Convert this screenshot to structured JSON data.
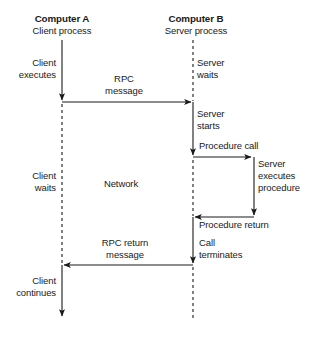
{
  "diagram": {
    "type": "sequence-diagram",
    "colors": {
      "line": "#1a1a1a",
      "text": "#1a1a1a",
      "background": "#ffffff"
    },
    "lifelines": [
      {
        "id": "computer-a",
        "title": "Computer A",
        "subtitle": "Client process",
        "x": 62
      },
      {
        "id": "computer-b",
        "title": "Computer B",
        "subtitle": "Server process",
        "x": 193
      }
    ],
    "labels": {
      "client_executes": "Client\nexecutes",
      "client_executes_line1": "Client",
      "client_executes_line2": "executes",
      "client_waits_line1": "Client",
      "client_waits_line2": "waits",
      "client_continues_line1": "Client",
      "client_continues_line2": "continues",
      "server_waits_line1": "Server",
      "server_waits_line2": "waits",
      "server_starts_line1": "Server",
      "server_starts_line2": "starts",
      "server_executes_line1": "Server",
      "server_executes_line2": "executes",
      "server_executes_line3": "procedure",
      "rpc_message_line1": "RPC",
      "rpc_message_line2": "message",
      "rpc_return_line1": "RPC return",
      "rpc_return_line2": "message",
      "network": "Network",
      "procedure_call": "Procedure call",
      "procedure_return": "Procedure return",
      "call_terminates_line1": "Call",
      "call_terminates_line2": "terminates"
    },
    "messages": [
      {
        "name": "rpc-message",
        "from": "computer-a",
        "to": "computer-b",
        "direction": "right",
        "y": 102,
        "label": "RPC message"
      },
      {
        "name": "procedure-call",
        "from": "computer-b",
        "to": "server-procedure",
        "direction": "right",
        "y": 157,
        "label": "Procedure call"
      },
      {
        "name": "procedure-return",
        "from": "server-procedure",
        "to": "computer-b",
        "direction": "left",
        "y": 217,
        "label": "Procedure return"
      },
      {
        "name": "rpc-return-message",
        "from": "computer-b",
        "to": "computer-a",
        "direction": "left",
        "y": 265,
        "label": "RPC return message"
      }
    ]
  }
}
